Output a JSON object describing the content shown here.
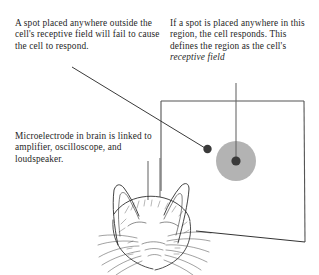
{
  "figure": {
    "title_visible": false,
    "captions": {
      "outside": "A spot placed anywhere outside the cell's receptive field will fail to cause the cell to respond.",
      "inside_lead": "If a spot is placed anywhere in this region, the cell responds. This defines the region as the cell's ",
      "inside_italic": "receptive field",
      "electrode": "Microelectrode in brain is linked to amplifier, oscilloscope, and loudspeaker."
    },
    "elements": {
      "screen_label": "visual-field-screen",
      "receptive_field_label": "receptive-field-circle",
      "spot_outside_label": "stimulus-spot-outside",
      "spot_inside_label": "stimulus-spot-inside",
      "animal_label": "cat-head-illustration",
      "electrode_label": "microelectrode"
    },
    "colors": {
      "ink": "#1f1f1f",
      "line": "#4a4a4a",
      "receptive_field_fill": "#b3b3b3",
      "spot_fill": "#3a3a3a",
      "background": "#ffffff"
    }
  }
}
